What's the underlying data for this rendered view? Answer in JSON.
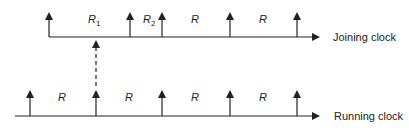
{
  "diagram": {
    "joining_clock": {
      "label": "Joining clock",
      "ticks_x": [
        49,
        130,
        162,
        230,
        297
      ],
      "intervals": [
        {
          "label": "R",
          "sub": "1",
          "x": 93
        },
        {
          "label": "R",
          "sub": "2",
          "x": 148
        },
        {
          "label": "R",
          "sub": "",
          "x": 196
        },
        {
          "label": "R",
          "sub": "",
          "x": 264
        }
      ]
    },
    "running_clock": {
      "label": "Running clock",
      "ticks_x": [
        30,
        96,
        162,
        230,
        297
      ],
      "intervals": [
        {
          "label": "R",
          "sub": "",
          "x": 63
        },
        {
          "label": "R",
          "sub": "",
          "x": 130
        },
        {
          "label": "R",
          "sub": "",
          "x": 196
        },
        {
          "label": "R",
          "sub": "",
          "x": 264
        }
      ]
    },
    "sync_link": {
      "x": 96,
      "style": "dashed"
    },
    "colors": {
      "stroke": "#222222",
      "background": "#ffffff"
    }
  }
}
